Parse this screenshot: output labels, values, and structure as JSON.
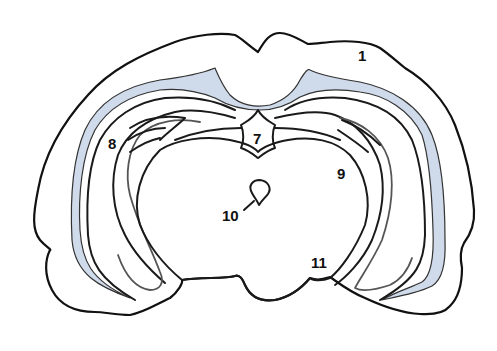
{
  "diagram": {
    "type": "coronal brain section outline",
    "colors": {
      "outline": "#111111",
      "ventricle_fill": "#cfdaea",
      "background": "#ffffff"
    },
    "labels": [
      {
        "id": "1",
        "text": "1"
      },
      {
        "id": "7",
        "text": "7"
      },
      {
        "id": "8",
        "text": "8"
      },
      {
        "id": "9",
        "text": "9"
      },
      {
        "id": "10",
        "text": "10"
      },
      {
        "id": "11",
        "text": "11"
      }
    ]
  }
}
